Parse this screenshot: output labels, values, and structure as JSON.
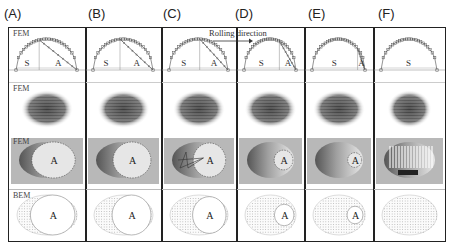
{
  "figure": {
    "column_labels": [
      "(A)",
      "(B)",
      "(C)",
      "(D)",
      "(E)",
      "(F)"
    ],
    "row_labels": [
      "FEM",
      "FEM",
      "FEM",
      "BEM"
    ],
    "annotation": "Rolling direction",
    "region_labels": {
      "stick": "S",
      "adhesion_slip": "A"
    },
    "columns": [
      {
        "label": "(A)",
        "has_S": true,
        "has_A": true,
        "slip_fraction": 0.62
      },
      {
        "label": "(B)",
        "has_S": true,
        "has_A": true,
        "slip_fraction": 0.55
      },
      {
        "label": "(C)",
        "has_S": true,
        "has_A": true,
        "slip_fraction": 0.48
      },
      {
        "label": "(D)",
        "has_S": true,
        "has_A": true,
        "slip_fraction": 0.32
      },
      {
        "label": "(E)",
        "has_S": true,
        "has_A": true,
        "slip_fraction": 0.14
      },
      {
        "label": "(F)",
        "has_S": true,
        "has_A": false,
        "slip_fraction": 0.0
      }
    ],
    "colors": {
      "frame": "#222222",
      "marker": "#555555",
      "pressure_dark": "#3a3a3a",
      "slip_bg": "#b8b8b8",
      "bem_lines": "#9a9a9a"
    }
  }
}
